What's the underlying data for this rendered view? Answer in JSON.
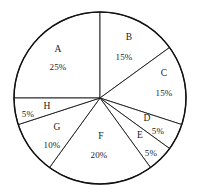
{
  "chart_data": {
    "type": "pie",
    "title": "",
    "subtitle": "",
    "xlabel": "",
    "ylabel": "",
    "legend_position": "none",
    "grid": false,
    "value_unit": "%",
    "start_angle_deg": 0,
    "categories": [
      "A",
      "B",
      "C",
      "D",
      "E",
      "F",
      "G",
      "H"
    ],
    "values": [
      25,
      15,
      15,
      5,
      5,
      20,
      10,
      5
    ],
    "total": 100,
    "slices": [
      {
        "label": "A",
        "value": 25,
        "value_text": "25%",
        "start_deg": 270,
        "sweep_deg": 90,
        "label_x": 58,
        "label_y": 50,
        "value_x": 58,
        "value_y": 67
      },
      {
        "label": "B",
        "value": 15,
        "value_text": "15%",
        "start_deg": 0,
        "sweep_deg": 54,
        "label_x": 129,
        "label_y": 38,
        "value_x": 124,
        "value_y": 57
      },
      {
        "label": "C",
        "value": 15,
        "value_text": "15%",
        "start_deg": 54,
        "sweep_deg": 54,
        "label_x": 164,
        "label_y": 74,
        "value_x": 164,
        "value_y": 93
      },
      {
        "label": "D",
        "value": 5,
        "value_text": "5%",
        "start_deg": 108,
        "sweep_deg": 18,
        "label_x": 147,
        "label_y": 119,
        "value_x": 158,
        "value_y": 131
      },
      {
        "label": "E",
        "value": 5,
        "value_text": "5%",
        "start_deg": 126,
        "sweep_deg": 18,
        "label_x": 140,
        "label_y": 136,
        "value_x": 151,
        "value_y": 153
      },
      {
        "label": "F",
        "value": 20,
        "value_text": "20%",
        "start_deg": 144,
        "sweep_deg": 72,
        "label_x": 101,
        "label_y": 137,
        "value_x": 99,
        "value_y": 155
      },
      {
        "label": "G",
        "value": 10,
        "value_text": "10%",
        "start_deg": 216,
        "sweep_deg": 36,
        "label_x": 57,
        "label_y": 128,
        "value_x": 52,
        "value_y": 145
      },
      {
        "label": "H",
        "value": 5,
        "value_text": "5%",
        "start_deg": 252,
        "sweep_deg": 18,
        "label_x": 47,
        "label_y": 107,
        "value_x": 28,
        "value_y": 114
      }
    ],
    "geometry": {
      "center_x": 100,
      "center_y": 98,
      "radius": 86
    },
    "colors": {
      "slice_fill": "#ffffff",
      "slice_stroke": "#1a1a1a",
      "outline": "#111111",
      "text": "#1a1a1a",
      "background": "#ffffff"
    }
  }
}
